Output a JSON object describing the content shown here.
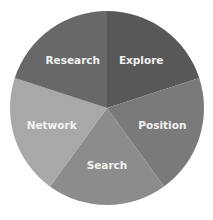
{
  "chart_data": {
    "type": "pie",
    "title": "",
    "categories": [
      "Explore",
      "Position",
      "Search",
      "Network",
      "Research"
    ],
    "values": [
      20,
      20,
      20,
      20,
      20
    ],
    "colors": [
      "#585858",
      "#7a7a7a",
      "#8c8c8c",
      "#a8a8a8",
      "#686868"
    ],
    "start_angle_deg": 0,
    "direction": "clockwise",
    "legend": "none",
    "labels_inside": true
  }
}
